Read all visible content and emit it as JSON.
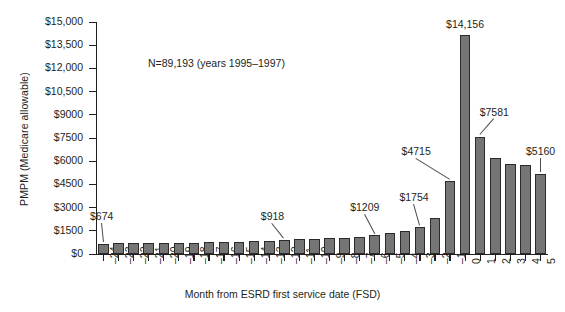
{
  "chart_data": {
    "type": "bar",
    "title": "",
    "subtitle": "",
    "annotation": "N=89,193 (years 1995–1997)",
    "xlabel": "Month from ESRD first service date (FSD)",
    "ylabel": "PMPM (Medicare allowable)",
    "grid": false,
    "legend": null,
    "ylim": [
      0,
      15000
    ],
    "ytick_values": [
      0,
      1500,
      3000,
      4500,
      6000,
      7500,
      9000,
      10500,
      12000,
      13500,
      15000
    ],
    "ytick_labels": [
      "$0",
      "$1500",
      "$3000",
      "$4500",
      "$6000",
      "$7500",
      "$9000",
      "$10,500",
      "$12,000",
      "$13,500",
      "$15,000"
    ],
    "categories": [
      "-24",
      "-23",
      "-22",
      "-21",
      "-20",
      "-19",
      "-18",
      "-17",
      "-16",
      "-15",
      "-14",
      "-13",
      "-12",
      "-11",
      "-10",
      "-9",
      "-8",
      "-7",
      "-6",
      "-5",
      "-4",
      "-3",
      "-2",
      "-1",
      "0",
      "1",
      "2",
      "3",
      "4",
      "5"
    ],
    "xtick_labels": [
      "–24",
      "–23",
      "–22",
      "–21",
      "–20",
      "–19",
      "–18",
      "–17",
      "–16",
      "–15",
      "–14",
      "–13",
      "–12",
      "–11",
      "–10",
      "–9",
      "–8",
      "–7",
      "–6",
      "–5",
      "–4",
      "–3",
      "–2",
      "–1",
      "0",
      "1",
      "2",
      "3",
      "4",
      "5"
    ],
    "values": [
      674,
      700,
      700,
      710,
      720,
      730,
      740,
      755,
      770,
      790,
      820,
      860,
      918,
      950,
      980,
      1010,
      1050,
      1110,
      1209,
      1330,
      1500,
      1754,
      2330,
      4715,
      14156,
      7581,
      6230,
      5830,
      5740,
      5160
    ],
    "bar_color": "#757575",
    "bar_edge_color": "#2b2b2b",
    "data_labels": [
      {
        "category": "-24",
        "text": "$674",
        "value": 674
      },
      {
        "category": "-12",
        "text": "$918",
        "value": 918
      },
      {
        "category": "-6",
        "text": "$1209",
        "value": 1209
      },
      {
        "category": "-3",
        "text": "$1754",
        "value": 1754
      },
      {
        "category": "-1",
        "text": "$4715",
        "value": 4715
      },
      {
        "category": "0",
        "text": "$14,156",
        "value": 14156
      },
      {
        "category": "1",
        "text": "$7581",
        "value": 7581
      },
      {
        "category": "5",
        "text": "$5160",
        "value": 5160
      }
    ]
  }
}
